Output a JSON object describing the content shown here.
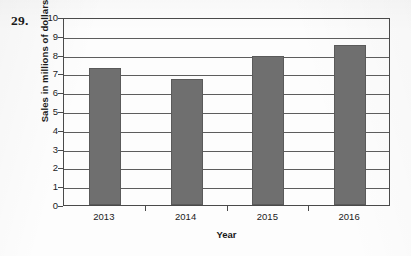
{
  "question_number": "29.",
  "chart_data": {
    "type": "bar",
    "title": "",
    "xlabel": "Year",
    "ylabel": "Sales in millions of dollars",
    "categories": [
      "2013",
      "2014",
      "2015",
      "2016"
    ],
    "values": [
      7.3,
      6.7,
      7.9,
      8.5
    ],
    "series": [
      {
        "name": "Sales",
        "values": [
          7.3,
          6.7,
          7.9,
          8.5
        ]
      }
    ],
    "ylim": [
      0,
      10
    ],
    "ytick_labels": [
      "10",
      "9",
      "8",
      "7",
      "6",
      "5",
      "4",
      "3",
      "2",
      "1",
      "0"
    ],
    "ytick_values": [
      10,
      9,
      8,
      7,
      6,
      5,
      4,
      3,
      2,
      1,
      0
    ],
    "grid": true,
    "grid_axis": "y",
    "legend": false,
    "legend_position": "none",
    "bar_color": "#6f6f6f",
    "axis_color": "#4a4a4a",
    "grid_color": "#5d5d5d",
    "background_color": "#fdfdfd"
  }
}
